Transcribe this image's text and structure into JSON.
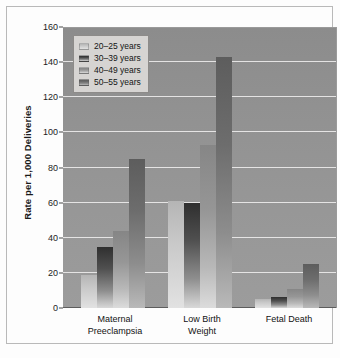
{
  "chart_data": {
    "type": "bar",
    "title": "",
    "subtitle": "",
    "xlabel": "",
    "ylabel": "Rate per 1,000 Deliveries",
    "ylim": [
      0,
      160
    ],
    "ytick_values": [
      0,
      20,
      40,
      60,
      80,
      100,
      120,
      140,
      160
    ],
    "ytick_labels": [
      "0",
      "20",
      "40",
      "60",
      "80",
      "100",
      "120",
      "140",
      "160"
    ],
    "grid": "horizontal",
    "legend_position": "top-left",
    "categories": [
      "Maternal Preeclampsia",
      "Low Birth Weight",
      "Fetal Death"
    ],
    "category_lines": [
      [
        "Maternal",
        "Preeclampsia"
      ],
      [
        "Low Birth",
        "Weight"
      ],
      [
        "Fetal Death"
      ]
    ],
    "series": [
      {
        "name": "20–25 years",
        "color": "#cfcfcf",
        "values": [
          19,
          61,
          5
        ]
      },
      {
        "name": "30–39 years",
        "color": "#3b3b3b",
        "values": [
          35,
          60,
          6.5
        ]
      },
      {
        "name": "40–49 years",
        "color": "#9a9a9a",
        "values": [
          44,
          93,
          11
        ]
      },
      {
        "name": "50–55 years",
        "color": "#6b6b6b",
        "values": [
          85,
          143,
          25
        ]
      }
    ]
  },
  "legend": {
    "items": [
      {
        "label": "20–25 years"
      },
      {
        "label": "30–39 years"
      },
      {
        "label": "40–49 years"
      },
      {
        "label": "50–55 years"
      }
    ]
  },
  "axes": {
    "y_title": "Rate per 1,000 Deliveries"
  },
  "colors": {
    "plot_background": "#949494",
    "gridline": "#eceaea",
    "frame": "#b9b9b9",
    "page_background": "#fdfdfd",
    "legend_background": "#d6d4d2"
  }
}
